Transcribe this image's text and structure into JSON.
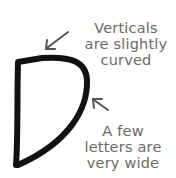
{
  "diagram": {
    "glyph": "D",
    "annotations": [
      {
        "lines": [
          "Verticals",
          "are slightly",
          "curved"
        ],
        "points_to": "top-left of vertical stroke"
      },
      {
        "lines": [
          "A few",
          "letters are",
          "very wide"
        ],
        "points_to": "right bowl of the letter"
      }
    ],
    "colors": {
      "stroke": "#111111",
      "text": "#6a6a6a",
      "arrow": "#555555",
      "background": "#ffffff"
    }
  }
}
